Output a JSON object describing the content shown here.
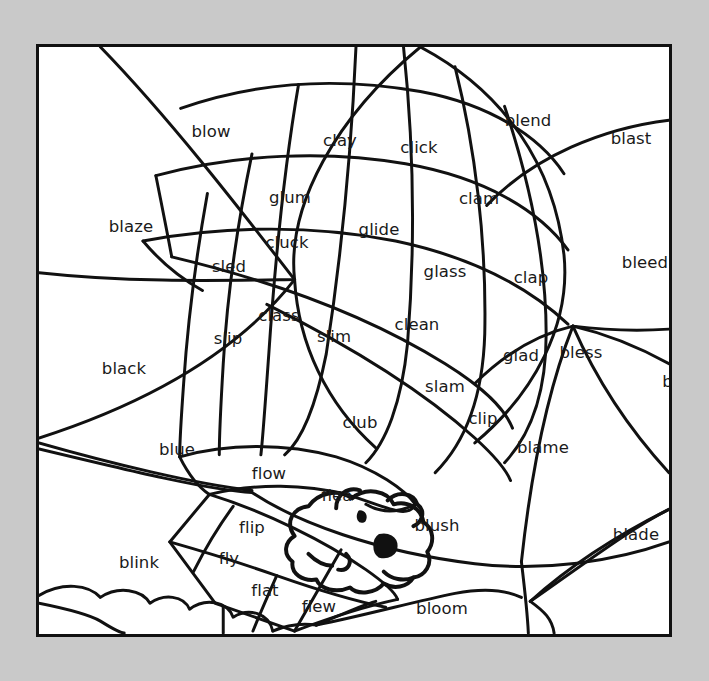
{
  "page": {
    "background_color": "#c9c9c9",
    "paper_color": "#ffffff",
    "border_color": "#111111",
    "ink_color": "#1a1a1a",
    "type": "color-by-word coloring worksheet"
  },
  "regions": [
    {
      "id": "blow",
      "label": "blow",
      "blend": "bl",
      "x": 172,
      "y": 85
    },
    {
      "id": "clay",
      "label": "clay",
      "blend": "cl",
      "x": 301,
      "y": 94
    },
    {
      "id": "click",
      "label": "click",
      "blend": "cl",
      "x": 380,
      "y": 101
    },
    {
      "id": "blend",
      "label": "blend",
      "blend": "bl",
      "x": 489,
      "y": 74
    },
    {
      "id": "blast",
      "label": "blast",
      "blend": "bl",
      "x": 592,
      "y": 92
    },
    {
      "id": "glum",
      "label": "glum",
      "blend": "gl",
      "x": 251,
      "y": 151
    },
    {
      "id": "clam",
      "label": "clam",
      "blend": "cl",
      "x": 440,
      "y": 152
    },
    {
      "id": "blaze",
      "label": "blaze",
      "blend": "bl",
      "x": 92,
      "y": 180
    },
    {
      "id": "glide",
      "label": "glide",
      "blend": "gl",
      "x": 340,
      "y": 183
    },
    {
      "id": "cluck",
      "label": "cluck",
      "blend": "cl",
      "x": 248,
      "y": 196
    },
    {
      "id": "sled",
      "label": "sled",
      "blend": "sl",
      "x": 190,
      "y": 220
    },
    {
      "id": "glass",
      "label": "glass",
      "blend": "gl",
      "x": 406,
      "y": 225
    },
    {
      "id": "clap",
      "label": "clap",
      "blend": "cl",
      "x": 492,
      "y": 231
    },
    {
      "id": "bleed",
      "label": "bleed",
      "blend": "bl",
      "x": 606,
      "y": 216
    },
    {
      "id": "class",
      "label": "class",
      "blend": "cl",
      "x": 240,
      "y": 269
    },
    {
      "id": "clean",
      "label": "clean",
      "blend": "cl",
      "x": 378,
      "y": 278
    },
    {
      "id": "slip",
      "label": "slip",
      "blend": "sl",
      "x": 189,
      "y": 292
    },
    {
      "id": "slim",
      "label": "slim",
      "blend": "sl",
      "x": 295,
      "y": 290
    },
    {
      "id": "glad",
      "label": "glad",
      "blend": "gl",
      "x": 482,
      "y": 309
    },
    {
      "id": "bless",
      "label": "bless",
      "blend": "bl",
      "x": 542,
      "y": 306
    },
    {
      "id": "black",
      "label": "black",
      "blend": "bl",
      "x": 85,
      "y": 322
    },
    {
      "id": "blank",
      "label": "blank",
      "blend": "bl",
      "x": 646,
      "y": 335
    },
    {
      "id": "slam",
      "label": "slam",
      "blend": "sl",
      "x": 406,
      "y": 340
    },
    {
      "id": "clip",
      "label": "clip",
      "blend": "cl",
      "x": 444,
      "y": 372
    },
    {
      "id": "club",
      "label": "club",
      "blend": "cl",
      "x": 321,
      "y": 376
    },
    {
      "id": "blue",
      "label": "blue",
      "blend": "bl",
      "x": 138,
      "y": 403
    },
    {
      "id": "blame",
      "label": "blame",
      "blend": "bl",
      "x": 504,
      "y": 401
    },
    {
      "id": "flow",
      "label": "flow",
      "blend": "fl",
      "x": 230,
      "y": 427
    },
    {
      "id": "flea",
      "label": "flea",
      "blend": "fl",
      "x": 298,
      "y": 449
    },
    {
      "id": "flip",
      "label": "flip",
      "blend": "fl",
      "x": 213,
      "y": 481
    },
    {
      "id": "blush",
      "label": "blush",
      "blend": "bl",
      "x": 398,
      "y": 479
    },
    {
      "id": "blade",
      "label": "blade",
      "blend": "bl",
      "x": 597,
      "y": 488
    },
    {
      "id": "fly",
      "label": "fly",
      "blend": "fl",
      "x": 190,
      "y": 512
    },
    {
      "id": "blink",
      "label": "blink",
      "blend": "bl",
      "x": 100,
      "y": 516
    },
    {
      "id": "flat",
      "label": "flat",
      "blend": "fl",
      "x": 226,
      "y": 544
    },
    {
      "id": "flew",
      "label": "flew",
      "blend": "fl",
      "x": 280,
      "y": 560
    },
    {
      "id": "bloom",
      "label": "bloom",
      "blend": "bl",
      "x": 403,
      "y": 562
    },
    {
      "id": "glue",
      "label": "glue",
      "blend": "gl",
      "x": 71,
      "y": 598
    },
    {
      "id": "gloom",
      "label": "gloom",
      "blend": "gl",
      "x": 152,
      "y": 623
    },
    {
      "id": "glow",
      "label": "glow",
      "blend": "gl",
      "x": 371,
      "y": 618
    },
    {
      "id": "globe",
      "label": "globe",
      "blend": "gl",
      "x": 636,
      "y": 622
    }
  ]
}
